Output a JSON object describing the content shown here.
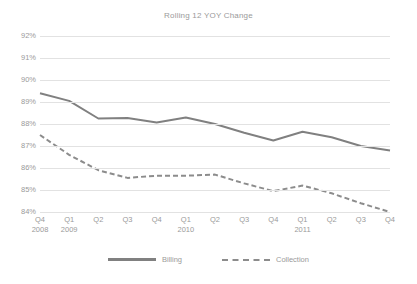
{
  "chart_data": {
    "type": "line",
    "title": "Rolling 12 YOY Change",
    "xlabel": "",
    "ylabel": "",
    "ylim": [
      84,
      92
    ],
    "yticks": [
      "84%",
      "85%",
      "86%",
      "87%",
      "88%",
      "89%",
      "90%",
      "91%",
      "92%"
    ],
    "ytick_values": [
      84,
      85,
      86,
      87,
      88,
      89,
      90,
      91,
      92
    ],
    "grid": true,
    "legend_position": "bottom",
    "categories": [
      {
        "quarter": "Q4",
        "year": "2008"
      },
      {
        "quarter": "Q1",
        "year": "2009"
      },
      {
        "quarter": "Q2",
        "year": ""
      },
      {
        "quarter": "Q3",
        "year": ""
      },
      {
        "quarter": "Q4",
        "year": ""
      },
      {
        "quarter": "Q1",
        "year": "2010"
      },
      {
        "quarter": "Q2",
        "year": ""
      },
      {
        "quarter": "Q3",
        "year": ""
      },
      {
        "quarter": "Q4",
        "year": ""
      },
      {
        "quarter": "Q1",
        "year": "2011"
      },
      {
        "quarter": "Q2",
        "year": ""
      },
      {
        "quarter": "Q3",
        "year": ""
      },
      {
        "quarter": "Q4",
        "year": ""
      }
    ],
    "series": [
      {
        "name": "Billing",
        "style": "solid",
        "color": "#808080",
        "values": [
          89.4,
          89.05,
          88.25,
          88.27,
          88.07,
          88.3,
          88.0,
          87.6,
          87.25,
          87.65,
          87.4,
          87.0,
          86.8
        ]
      },
      {
        "name": "Collection",
        "style": "dashed",
        "color": "#8c8c8c",
        "values": [
          87.5,
          86.6,
          85.9,
          85.55,
          85.65,
          85.65,
          85.7,
          85.3,
          84.95,
          85.2,
          84.85,
          84.4,
          84.0
        ]
      }
    ]
  },
  "legend": {
    "items": [
      {
        "label": "Billing"
      },
      {
        "label": "Collection"
      }
    ]
  }
}
